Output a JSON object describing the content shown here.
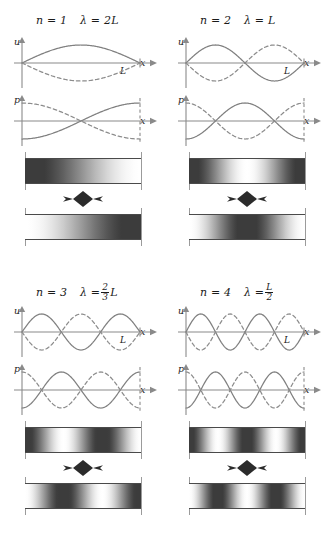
{
  "figure": {
    "axis_labels": {
      "u": "u",
      "p": "p",
      "x": "x",
      "L": "L"
    },
    "colors": {
      "curve_solid": "#808080",
      "curve_dashed": "#8c8c8c",
      "axis": "#8a8a8a",
      "tube_border": "#4a4a4a",
      "wall": "#9b9b9b",
      "arrow": "#2b2b2b",
      "text": "#1a1a1a"
    }
  },
  "panels": [
    {
      "id": "mode-1",
      "n_label": "n = 1",
      "n_value": 1,
      "lambda_label": "λ = 2L",
      "lambda_numer": "2",
      "lambda_denom": "",
      "lambda_is_fraction": false,
      "lambda_prefix": "λ =",
      "lambda_text": "2L",
      "half_wavelengths": 1
    },
    {
      "id": "mode-2",
      "n_label": "n = 2",
      "n_value": 2,
      "lambda_label": "λ = L",
      "lambda_numer": "",
      "lambda_denom": "",
      "lambda_is_fraction": false,
      "lambda_prefix": "λ =",
      "lambda_text": "L",
      "half_wavelengths": 2
    },
    {
      "id": "mode-3",
      "n_label": "n = 3",
      "n_value": 3,
      "lambda_label": "λ = 2/3 L",
      "lambda_numer": "2",
      "lambda_denom": "3",
      "lambda_is_fraction": true,
      "lambda_prefix": "λ =",
      "lambda_text": "L",
      "half_wavelengths": 3
    },
    {
      "id": "mode-4",
      "n_label": "n = 4",
      "n_value": 4,
      "lambda_label": "λ = L/2",
      "lambda_numer": "L",
      "lambda_denom": "2",
      "lambda_is_fraction": true,
      "lambda_prefix": "λ =",
      "lambda_text": "",
      "half_wavelengths": 4
    }
  ],
  "chart_data": {
    "type": "line",
    "xlabel": "x",
    "ylabel_displacement": "u",
    "ylabel_pressure": "p",
    "xlim": [
      0,
      1
    ],
    "xticks": [
      0,
      1
    ],
    "xticklabels": [
      "",
      "L"
    ],
    "grid": false,
    "legend": "none",
    "series_note": "solid = wave at t=0, dashed = wave at half period later (inverted)",
    "modes": [
      {
        "n": 1,
        "lambda_over_L": 2,
        "displacement": {
          "form": "sin(n*pi*x/L)",
          "nodes_x": [
            0,
            1
          ],
          "antinodes_x": [
            0.5
          ]
        },
        "pressure": {
          "form": "-cos(n*pi*x/L)",
          "nodes_x": [
            0.5
          ],
          "antinodes_x": [
            0,
            1
          ]
        }
      },
      {
        "n": 2,
        "lambda_over_L": 1,
        "displacement": {
          "form": "sin(n*pi*x/L)",
          "nodes_x": [
            0,
            0.5,
            1
          ],
          "antinodes_x": [
            0.25,
            0.75
          ]
        },
        "pressure": {
          "form": "-cos(n*pi*x/L)",
          "nodes_x": [
            0.25,
            0.75
          ],
          "antinodes_x": [
            0,
            0.5,
            1
          ]
        }
      },
      {
        "n": 3,
        "lambda_over_L": 0.6667,
        "displacement": {
          "form": "sin(n*pi*x/L)",
          "nodes_x": [
            0,
            0.3333,
            0.6667,
            1
          ],
          "antinodes_x": [
            0.1667,
            0.5,
            0.8333
          ]
        },
        "pressure": {
          "form": "-cos(n*pi*x/L)",
          "nodes_x": [
            0.1667,
            0.5,
            0.8333
          ],
          "antinodes_x": [
            0,
            0.3333,
            0.6667,
            1
          ]
        }
      },
      {
        "n": 4,
        "lambda_over_L": 0.5,
        "displacement": {
          "form": "sin(n*pi*x/L)",
          "nodes_x": [
            0,
            0.25,
            0.5,
            0.75,
            1
          ],
          "antinodes_x": [
            0.125,
            0.375,
            0.625,
            0.875
          ]
        },
        "pressure": {
          "form": "-cos(n*pi*x/L)",
          "nodes_x": [
            0.125,
            0.375,
            0.625,
            0.875
          ],
          "antinodes_x": [
            0,
            0.25,
            0.5,
            0.75,
            1
          ]
        }
      }
    ],
    "density_bars": {
      "description": "Two snapshots of gas density along the tube; dark = compression, light = rarefaction",
      "phases": [
        "t = 0",
        "t = T/2"
      ]
    }
  }
}
